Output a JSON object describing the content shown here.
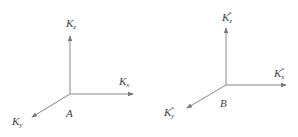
{
  "diagrams": [
    {
      "name": "A",
      "origin_label": "A",
      "axes": {
        "z": {
          "base": "K",
          "sub": "z",
          "sup": ""
        },
        "x": {
          "base": "K",
          "sub": "x",
          "sup": ""
        },
        "y": {
          "base": "K",
          "sub": "y",
          "sup": ""
        }
      }
    },
    {
      "name": "B",
      "origin_label": "B",
      "axes": {
        "z": {
          "base": "K",
          "sub": "z",
          "sup": "*"
        },
        "x": {
          "base": "K",
          "sub": "x",
          "sup": "*"
        },
        "y": {
          "base": "K",
          "sub": "y",
          "sup": "*"
        }
      }
    }
  ],
  "colors": {
    "axis": "#777777",
    "text": "#444444"
  }
}
